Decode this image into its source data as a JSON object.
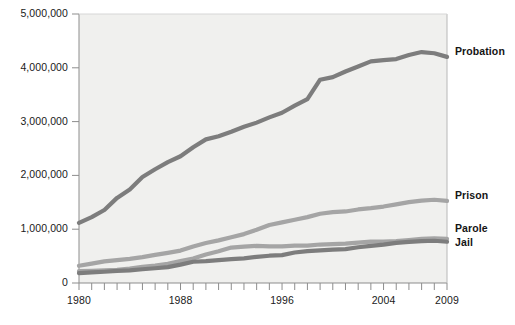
{
  "chart_data": {
    "type": "line",
    "title": "",
    "subtitle": "",
    "xlabel": "",
    "ylabel": "",
    "xlim": [
      1980,
      2009
    ],
    "ylim": [
      0,
      5000000
    ],
    "grid": false,
    "legend_position": "right-inline",
    "y_ticks": [
      0,
      1000000,
      2000000,
      3000000,
      4000000,
      5000000
    ],
    "y_tick_labels": [
      "0",
      "1,000,000",
      "2,000,000",
      "3,000,000",
      "4,000,000",
      "5,000,000"
    ],
    "x_ticks": [
      1980,
      1981,
      1982,
      1983,
      1984,
      1985,
      1986,
      1987,
      1988,
      1989,
      1990,
      1991,
      1992,
      1993,
      1994,
      1995,
      1996,
      1997,
      1998,
      1999,
      2000,
      2001,
      2002,
      2003,
      2004,
      2005,
      2006,
      2007,
      2008,
      2009
    ],
    "x_tick_labels": [
      "1980",
      "1988",
      "1996",
      "2004",
      "2009"
    ],
    "x_tick_labels_years": [
      1980,
      1988,
      1996,
      2004,
      2009
    ],
    "x": [
      1980,
      1981,
      1982,
      1983,
      1984,
      1985,
      1986,
      1987,
      1988,
      1989,
      1990,
      1991,
      1992,
      1993,
      1994,
      1995,
      1996,
      1997,
      1998,
      1999,
      2000,
      2001,
      2002,
      2003,
      2004,
      2005,
      2006,
      2007,
      2008,
      2009
    ],
    "series": [
      {
        "name": "Probation",
        "color": "#7d7d7d",
        "values": [
          1118000,
          1225000,
          1357000,
          1582000,
          1740000,
          1969000,
          2115000,
          2247000,
          2356000,
          2522000,
          2670000,
          2729000,
          2812000,
          2903000,
          2981000,
          3078000,
          3165000,
          3296000,
          3417000,
          3779000,
          3826000,
          3932000,
          4025000,
          4120000,
          4144000,
          4162000,
          4237000,
          4293000,
          4271000,
          4203000
        ]
      },
      {
        "name": "Prison",
        "color": "#a5a5a5",
        "values": [
          320000,
          360000,
          402000,
          424000,
          449000,
          480000,
          522000,
          560000,
          603000,
          680000,
          743000,
          792000,
          850000,
          909000,
          990000,
          1078000,
          1127000,
          1176000,
          1224000,
          1287000,
          1316000,
          1330000,
          1367000,
          1391000,
          1421000,
          1462000,
          1502000,
          1532000,
          1547000,
          1525000
        ]
      },
      {
        "name": "Parole",
        "color": "#a5a5a5",
        "values": [
          220000,
          225000,
          234000,
          246000,
          266000,
          300000,
          323000,
          356000,
          408000,
          456000,
          531000,
          590000,
          658000,
          676000,
          690000,
          679000,
          680000,
          695000,
          696000,
          715000,
          724000,
          732000,
          750000,
          769000,
          771000,
          780000,
          799000,
          821000,
          828000,
          819000
        ]
      },
      {
        "name": "Jail",
        "color": "#7d7d7d",
        "values": [
          182000,
          196000,
          209000,
          224000,
          234000,
          256000,
          274000,
          295000,
          341000,
          395000,
          405000,
          426000,
          444000,
          459000,
          486000,
          507000,
          518000,
          567000,
          592000,
          605000,
          621000,
          631000,
          665000,
          691000,
          713000,
          747000,
          766000,
          780000,
          785000,
          767000
        ]
      }
    ],
    "annotations": []
  },
  "axis": {
    "y_title": "",
    "x_title": ""
  }
}
